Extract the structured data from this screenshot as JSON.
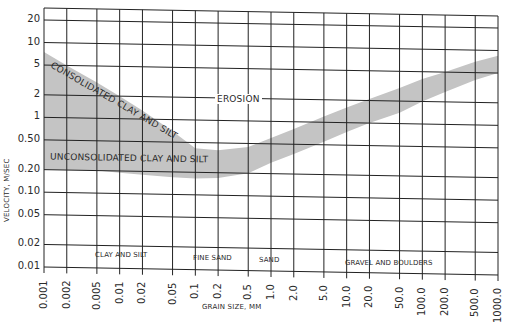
{
  "chart_data": {
    "type": "area",
    "title": "",
    "xlabel": "GRAIN SIZE, MM",
    "ylabel": "VELOCITY, M/SEC",
    "x_scale": "log",
    "y_scale": "log",
    "xlim": [
      0.001,
      1000.0
    ],
    "ylim": [
      0.01,
      30
    ],
    "grid": true,
    "x_tick_labels": [
      "0.001",
      "0.002",
      "0.005",
      "0.01",
      "0.02",
      "0.05",
      "0.1",
      "0.2",
      "0.5",
      "1.0",
      "2.0",
      "5.0",
      "10.0",
      "20.0",
      "50.0",
      "100.0",
      "200.0",
      "500.0",
      "1000.0"
    ],
    "x_tick_values": [
      0.001,
      0.002,
      0.005,
      0.01,
      0.02,
      0.05,
      0.1,
      0.2,
      0.5,
      1.0,
      2.0,
      5.0,
      10.0,
      20.0,
      50.0,
      100.0,
      200.0,
      500.0,
      1000.0
    ],
    "y_tick_labels": [
      "20",
      "10",
      "5",
      "2",
      "1",
      "0.50",
      "0.20",
      "0.10",
      "0.05",
      "0.02",
      "0.01"
    ],
    "y_tick_values": [
      20,
      10,
      5,
      2,
      1,
      0.5,
      0.2,
      0.1,
      0.05,
      0.02,
      0.01
    ],
    "series": [
      {
        "name": "Upper boundary (consolidated clay and silt)",
        "x": [
          0.001,
          0.002,
          0.005,
          0.01,
          0.02,
          0.05,
          0.1,
          0.2,
          0.5,
          1.0,
          2.0,
          5.0,
          10.0,
          20.0,
          50.0,
          100.0,
          200.0,
          500.0,
          1000.0
        ],
        "values": [
          7.5,
          5.0,
          3.0,
          2.0,
          1.3,
          0.7,
          0.42,
          0.4,
          0.45,
          0.6,
          0.8,
          1.2,
          1.6,
          2.1,
          3.0,
          4.0,
          5.0,
          7.0,
          8.5
        ]
      },
      {
        "name": "Lower boundary (unconsolidated clay and silt)",
        "x": [
          0.001,
          0.002,
          0.005,
          0.01,
          0.02,
          0.05,
          0.1,
          0.2,
          0.5,
          1.0,
          2.0,
          5.0,
          10.0,
          20.0,
          50.0,
          100.0,
          200.0,
          500.0,
          1000.0
        ],
        "values": [
          0.2,
          0.2,
          0.2,
          0.19,
          0.18,
          0.17,
          0.165,
          0.17,
          0.2,
          0.28,
          0.37,
          0.55,
          0.75,
          1.0,
          1.4,
          2.0,
          2.7,
          4.0,
          5.0
        ]
      }
    ],
    "band_color": "#c4c4c4",
    "annotations": [
      {
        "text": "EROSION",
        "x": 1.5,
        "y": 2
      },
      {
        "text": "CONSOLIDATED CLAY AND SILT",
        "along": "upper boundary"
      },
      {
        "text": "UNCONSOLIDATED CLAY AND SILT",
        "along": "lower boundary"
      }
    ],
    "regions": [
      {
        "text": "CLAY AND SILT",
        "from": 0.005,
        "to": 0.05
      },
      {
        "text": "FINE SAND",
        "from": 0.05,
        "to": 0.5
      },
      {
        "text": "SAND",
        "from": 0.5,
        "to": 2.0
      },
      {
        "text": "GRAVEL AND BOULDERS",
        "from": 2.0,
        "to": 1000.0
      }
    ]
  },
  "labels": {
    "ylabel": "VELOCITY, M/SEC",
    "xlabel": "GRAIN SIZE, MM",
    "erosion": "EROSION",
    "consolidated": "CONSOLIDATED CLAY AND SILT",
    "unconsolidated": "UNCONSOLIDATED CLAY AND SILT",
    "region_clay": "CLAY AND SILT",
    "region_fine_sand": "FINE SAND",
    "region_sand": "SAND",
    "region_gravel": "GRAVEL AND BOULDERS"
  },
  "ticks": {
    "y": [
      "20",
      "10",
      "5",
      "2",
      "1",
      "0.50",
      "0.20",
      "0.10",
      "0.05",
      "0.02",
      "0.01"
    ],
    "x": [
      "0.001",
      "0.002",
      "0.005",
      "0.01",
      "0.02",
      "0.05",
      "0.1",
      "0.2",
      "0.5",
      "1.0",
      "2.0",
      "5.0",
      "10.0",
      "20.0",
      "50.0",
      "100.0",
      "200.0",
      "500.0",
      "1000.0"
    ]
  }
}
